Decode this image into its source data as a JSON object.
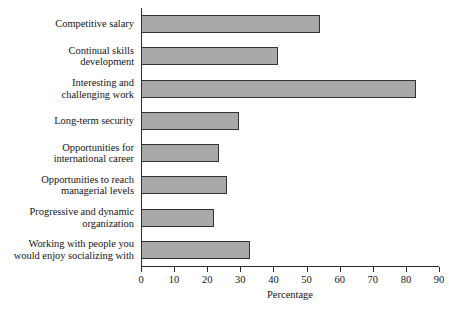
{
  "chart_data": {
    "type": "bar",
    "orientation": "horizontal",
    "title": "",
    "xlabel": "Percentage",
    "ylabel": "",
    "xlim": [
      0,
      90
    ],
    "xticks": [
      0,
      10,
      20,
      30,
      40,
      50,
      60,
      70,
      80,
      90
    ],
    "grid": false,
    "legend": null,
    "bar_color": "#a9a9a9",
    "bar_border_color": "#333333",
    "axis_color": "#2a2a2a",
    "categories": [
      "Competitive salary",
      "Continual skills development",
      "Interesting and challenging work",
      "Long-term security",
      "Opportunities for international career",
      "Opportunities to reach managerial levels",
      "Progressive and dynamic organization",
      "Working with people you would enjoy socializing with"
    ],
    "values": [
      54,
      41.5,
      83,
      29.5,
      23.5,
      26,
      22,
      33
    ]
  },
  "labels": {
    "lines": [
      [
        "Competitive salary"
      ],
      [
        "Continual skills",
        "development"
      ],
      [
        "Interesting and",
        "challenging work"
      ],
      [
        "Long-term security"
      ],
      [
        "Opportunities for",
        "international career"
      ],
      [
        "Opportunities to reach",
        "managerial levels"
      ],
      [
        "Progressive and dynamic",
        "organization"
      ],
      [
        "Working with people you",
        "would enjoy socializing with"
      ]
    ]
  }
}
